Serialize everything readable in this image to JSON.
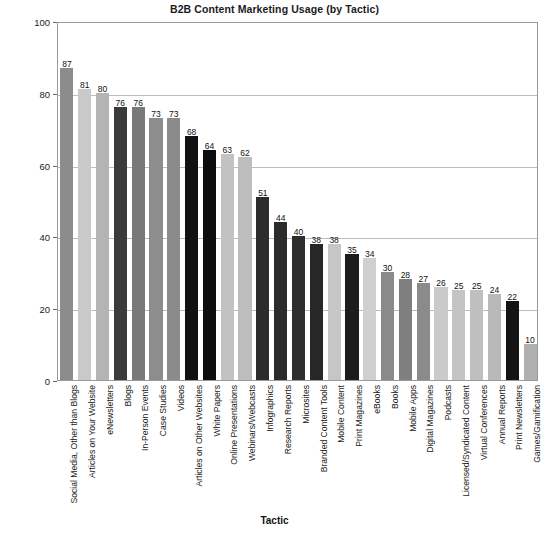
{
  "chart_data": {
    "type": "bar",
    "title": "B2B Content Marketing Usage (by Tactic)",
    "xlabel": "Tactic",
    "ylabel": "Percentage",
    "ylim": [
      0,
      100
    ],
    "yticks": [
      0,
      20,
      40,
      60,
      80,
      100
    ],
    "grid": true,
    "legend": "none",
    "categories": [
      "Social Media, Other than Blogs",
      "Articles on Your Website",
      "eNewsletters",
      "Blogs",
      "In-Person Events",
      "Case Studies",
      "Videos",
      "Articles on Other Websites",
      "White Papers",
      "Online Presentations",
      "Webinars/Webcasts",
      "Infographics",
      "Research Reports",
      "Microsites",
      "Branded Content Tools",
      "Mobile Content",
      "Print Magazines",
      "eBooks",
      "Books",
      "Mobile Apps",
      "Digital Magazines",
      "Podcasts",
      "Licensed/Syndicated Content",
      "Virtual Conferences",
      "Annual Reports",
      "Print Newsletters",
      "Games/Gamification"
    ],
    "values": [
      87,
      81,
      80,
      76,
      76,
      73,
      73,
      68,
      64,
      63,
      62,
      51,
      44,
      40,
      38,
      38,
      35,
      34,
      30,
      28,
      27,
      26,
      25,
      25,
      24,
      22,
      10
    ],
    "colors": [
      "#8c8c8c",
      "#c9c9c9",
      "#b4b4b4",
      "#3b3b3b",
      "#797979",
      "#8d8d8d",
      "#8b8b8b",
      "#121212",
      "#0d0d0d",
      "#c2c2c2",
      "#bdbdbd",
      "#2c2c2c",
      "#2b2b2b",
      "#2e2e2e",
      "#272727",
      "#c6c6c6",
      "#1c1c1c",
      "#cfcfcf",
      "#8a8a8a",
      "#7f7f7f",
      "#8b8b8b",
      "#cacaca",
      "#c4c4c4",
      "#bfbfbf",
      "#b9b9b9",
      "#141414",
      "#b0b0b0"
    ]
  }
}
